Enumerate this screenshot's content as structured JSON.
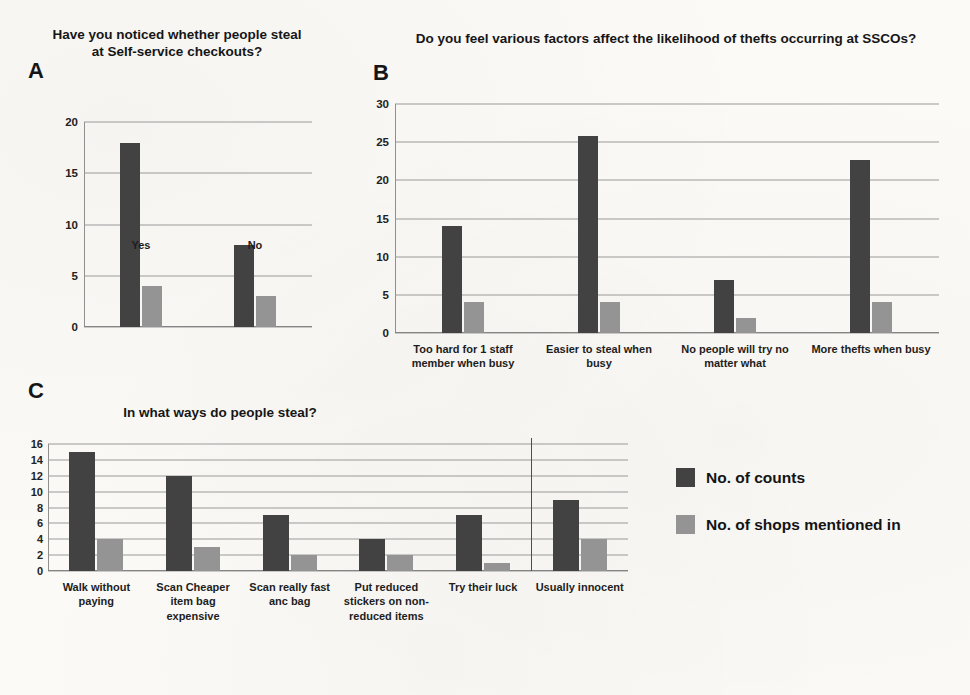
{
  "figure": {
    "background": "#fbfaf7",
    "series_colors": {
      "dark": "#424242",
      "light": "#949494"
    }
  },
  "legend": {
    "items": [
      {
        "label": "No. of counts",
        "color": "#424242",
        "key": "dark"
      },
      {
        "label": "No. of shops mentioned in",
        "color": "#949494",
        "key": "light"
      }
    ]
  },
  "panels": {
    "a": {
      "letter": "A",
      "title": "Have you noticed whether people steal at Self-service checkouts?"
    },
    "b": {
      "letter": "B",
      "title": "Do you feel various factors affect the likelihood of thefts occurring at SSCOs?"
    },
    "c": {
      "letter": "C",
      "title": "In what ways do people steal?"
    }
  },
  "chart_data": [
    {
      "id": "panel-a",
      "type": "bar",
      "title": "Have you noticed whether people steal at Self-service checkouts?",
      "panel_letter": "A",
      "xlabel": "",
      "ylabel": "",
      "ylim": [
        0,
        20
      ],
      "yticks": [
        0,
        5,
        10,
        15,
        20
      ],
      "grid": true,
      "legend_position": "shared-right",
      "categories": [
        "Yes",
        "No"
      ],
      "series": [
        {
          "name": "No. of counts",
          "color": "#424242",
          "values": [
            18,
            8
          ]
        },
        {
          "name": "No. of shops mentioned in",
          "color": "#949494",
          "values": [
            4,
            3
          ]
        }
      ]
    },
    {
      "id": "panel-b",
      "type": "bar",
      "title": "Do you feel various factors affect the likelihood of thefts occurring at SSCOs?",
      "panel_letter": "B",
      "xlabel": "",
      "ylabel": "",
      "ylim": [
        0,
        30
      ],
      "yticks": [
        0,
        5,
        10,
        15,
        20,
        25,
        30
      ],
      "grid": true,
      "legend_position": "shared-right",
      "categories": [
        "Too hard for 1 staff member when busy",
        "Easier to steal when busy",
        "No people will try no matter what",
        "More thefts when busy"
      ],
      "series": [
        {
          "name": "No. of counts",
          "color": "#424242",
          "values": [
            14,
            25.8,
            7,
            22.7
          ]
        },
        {
          "name": "No. of shops mentioned in",
          "color": "#949494",
          "values": [
            4,
            4,
            2,
            4
          ]
        }
      ]
    },
    {
      "id": "panel-c",
      "type": "bar",
      "title": "In what ways do people steal?",
      "panel_letter": "C",
      "xlabel": "",
      "ylabel": "",
      "ylim": [
        0,
        16
      ],
      "yticks": [
        0,
        2,
        4,
        6,
        8,
        10,
        12,
        14,
        16
      ],
      "grid": true,
      "legend_position": "right",
      "divider_after_category_index": 4,
      "categories": [
        "Walk without paying",
        "Scan Cheaper item bag expensive",
        "Scan really fast anc bag",
        "Put reduced stickers on non-reduced items",
        "Try their luck",
        "Usually innocent"
      ],
      "series": [
        {
          "name": "No. of counts",
          "color": "#424242",
          "values": [
            15,
            12,
            7,
            4,
            7,
            9
          ]
        },
        {
          "name": "No. of shops mentioned in",
          "color": "#949494",
          "values": [
            4,
            3,
            2,
            2,
            1,
            4
          ]
        }
      ]
    }
  ]
}
